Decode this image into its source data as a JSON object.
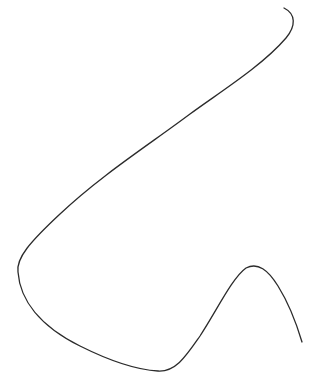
{
  "canvas": {
    "width": 314,
    "height": 390,
    "background": "#ffffff"
  },
  "drawing": {
    "stroke_color": "#2b2b2b",
    "stroke_width": 1.3,
    "path": "M 284 8 C 296 14, 296 26, 286 38 C 262 66, 220 92, 190 114 C 150 144, 100 176, 60 214 C 30 242, 16 258, 18 272 C 20 300, 40 326, 80 346 C 112 362, 140 370, 158 371 C 176 372, 186 356, 200 336 C 216 312, 232 278, 246 268 C 258 262, 268 270, 278 286 C 288 302, 296 322, 302 342"
  }
}
